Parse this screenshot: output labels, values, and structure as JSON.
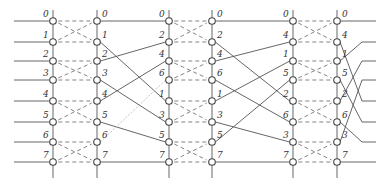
{
  "diagram": {
    "type": "butterfly-network",
    "size": 8,
    "stages": [
      {
        "input_labels": [
          "0",
          "1",
          "2",
          "3",
          "4",
          "5",
          "6",
          "7"
        ],
        "output_labels": [
          "0",
          "1",
          "2",
          "3",
          "4",
          "5",
          "6",
          "7"
        ]
      },
      {
        "input_labels": [
          "0",
          "2",
          "4",
          "6",
          "1",
          "3",
          "5",
          "7"
        ],
        "output_labels": [
          "0",
          "2",
          "4",
          "6",
          "1",
          "3",
          "5",
          "7"
        ]
      },
      {
        "input_labels": [
          "0",
          "4",
          "1",
          "5",
          "2",
          "6",
          "3",
          "7"
        ],
        "output_labels": [
          "0",
          "4",
          "1",
          "5",
          "2",
          "6",
          "3",
          "7"
        ]
      }
    ],
    "butterfly_pairs": [
      [
        0,
        1
      ],
      [
        2,
        3
      ],
      [
        4,
        5
      ],
      [
        6,
        7
      ]
    ],
    "output_order": [
      "0",
      "1",
      "2",
      "3",
      "4",
      "5",
      "6",
      "7"
    ]
  }
}
